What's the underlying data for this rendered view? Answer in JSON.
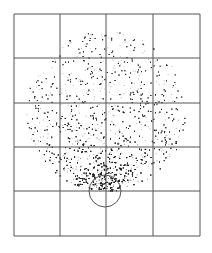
{
  "figure": {
    "width": 212,
    "height": 253,
    "background": "#ffffff",
    "grid": {
      "color": "#555555",
      "line_width": 1,
      "x_lines": [
        14,
        60,
        106,
        153,
        200
      ],
      "y_lines": [
        14,
        58,
        103,
        147,
        191,
        236
      ]
    },
    "scatter_region": {
      "shape": "circle",
      "center": [
        106,
        111
      ],
      "radius": 80,
      "dot_color": "#1a1a1a",
      "dense_point": [
        105,
        191
      ],
      "point_count": 5200
    },
    "small_circle": {
      "center": [
        105,
        191
      ],
      "radius": 16,
      "stroke": "#555555"
    }
  }
}
